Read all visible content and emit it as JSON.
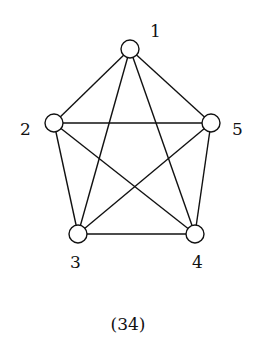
{
  "graph": {
    "nodes": [
      {
        "id": "1",
        "label": "1",
        "x": 130,
        "y": 49,
        "lx": 150,
        "ly": 37
      },
      {
        "id": "2",
        "label": "2",
        "x": 54,
        "y": 123,
        "lx": 20,
        "ly": 135
      },
      {
        "id": "3",
        "label": "3",
        "x": 78,
        "y": 234,
        "lx": 70,
        "ly": 268
      },
      {
        "id": "4",
        "label": "4",
        "x": 195,
        "y": 234,
        "lx": 192,
        "ly": 268
      },
      {
        "id": "5",
        "label": "5",
        "x": 211,
        "y": 123,
        "lx": 232,
        "ly": 135
      }
    ],
    "edges": [
      [
        "1",
        "2"
      ],
      [
        "1",
        "3"
      ],
      [
        "1",
        "4"
      ],
      [
        "1",
        "5"
      ],
      [
        "2",
        "3"
      ],
      [
        "2",
        "4"
      ],
      [
        "2",
        "5"
      ],
      [
        "3",
        "4"
      ],
      [
        "3",
        "5"
      ],
      [
        "4",
        "5"
      ]
    ],
    "node_radius": 9
  },
  "caption": "(34)"
}
